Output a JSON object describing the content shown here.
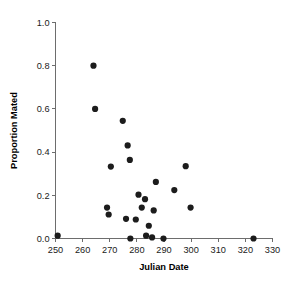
{
  "chart_data": {
    "type": "scatter",
    "title": "",
    "xlabel": "Julian Date",
    "ylabel": "Proportion Mated",
    "xlim": [
      250,
      330
    ],
    "ylim": [
      0.0,
      1.0
    ],
    "xticks": [
      250,
      260,
      270,
      280,
      290,
      300,
      310,
      320,
      330
    ],
    "xtick_labels": [
      "250",
      "260",
      "270",
      "280",
      "290",
      "300",
      "310",
      "320",
      "330"
    ],
    "yticks": [
      0.0,
      0.2,
      0.4,
      0.6,
      0.8,
      1.0
    ],
    "ytick_labels": [
      "0.0",
      "0.2",
      "0.4",
      "0.6",
      "0.8",
      "1.0"
    ],
    "grid": false,
    "legend": false,
    "marker": "filled-circle",
    "marker_color": "#1c1c1c",
    "marker_size": 3.1,
    "axis_color": "#6d6d6d",
    "background": "#ffffff",
    "series": [
      {
        "name": "Proportion Mated",
        "points": [
          {
            "x": 250.8,
            "y": 0.013
          },
          {
            "x": 264.0,
            "y": 0.8
          },
          {
            "x": 264.6,
            "y": 0.6
          },
          {
            "x": 270.4,
            "y": 0.333
          },
          {
            "x": 269.0,
            "y": 0.143
          },
          {
            "x": 269.6,
            "y": 0.111
          },
          {
            "x": 274.8,
            "y": 0.545
          },
          {
            "x": 276.6,
            "y": 0.431
          },
          {
            "x": 277.4,
            "y": 0.364
          },
          {
            "x": 277.6,
            "y": 0.0
          },
          {
            "x": 276.0,
            "y": 0.091
          },
          {
            "x": 279.6,
            "y": 0.088
          },
          {
            "x": 280.6,
            "y": 0.203
          },
          {
            "x": 281.8,
            "y": 0.143
          },
          {
            "x": 283.0,
            "y": 0.182
          },
          {
            "x": 283.4,
            "y": 0.013
          },
          {
            "x": 284.4,
            "y": 0.059
          },
          {
            "x": 285.6,
            "y": 0.005
          },
          {
            "x": 286.2,
            "y": 0.13
          },
          {
            "x": 287.0,
            "y": 0.262
          },
          {
            "x": 289.8,
            "y": 0.0
          },
          {
            "x": 293.8,
            "y": 0.224
          },
          {
            "x": 298.0,
            "y": 0.335
          },
          {
            "x": 299.8,
            "y": 0.143
          },
          {
            "x": 323.0,
            "y": 0.0
          }
        ]
      }
    ]
  }
}
